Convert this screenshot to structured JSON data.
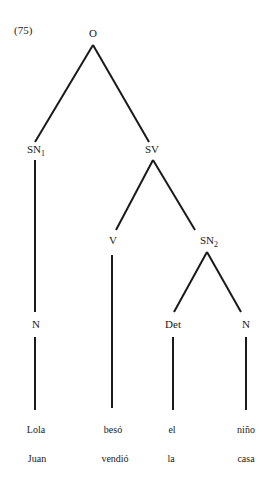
{
  "example_number": "(75)",
  "nodes": {
    "root": "O",
    "sn1": {
      "base": "SN",
      "sub": "1"
    },
    "sv": "SV",
    "v": "V",
    "sn2": {
      "base": "SN",
      "sub": "2"
    },
    "n_left": "N",
    "det": "Det",
    "n_right": "N"
  },
  "leaves": {
    "row1": [
      "Lola",
      "besó",
      "el",
      "niño"
    ],
    "row2": [
      "Juan",
      "vendió",
      "la",
      "casa"
    ]
  },
  "colors": {
    "line": "#1a1a1a",
    "background": "#ffffff"
  }
}
